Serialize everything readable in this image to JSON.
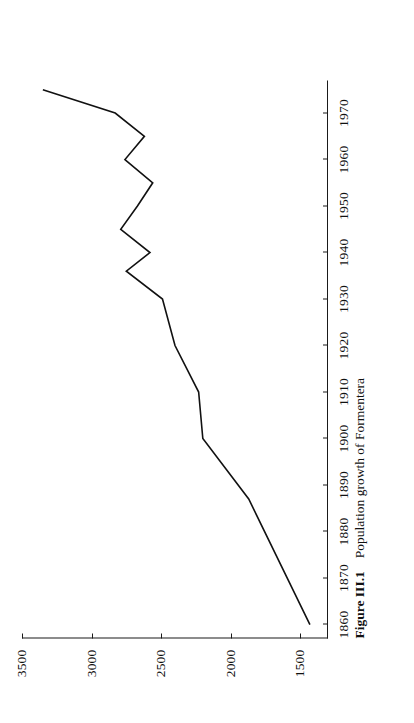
{
  "figure": {
    "caption_label": "Figure III.1",
    "caption_text": "Population growth of Formentera",
    "orientation": "rotated-90-ccw",
    "page_background": "#ffffff",
    "ink_color": "#111111"
  },
  "chart_data": {
    "type": "line",
    "title": "Population growth of Formentera",
    "xlabel": "",
    "ylabel": "",
    "xlim": [
      1857,
      1977
    ],
    "ylim": [
      1300,
      3500
    ],
    "grid": false,
    "legend": "none",
    "xticks": [
      1860,
      1870,
      1880,
      1890,
      1900,
      1910,
      1920,
      1930,
      1940,
      1950,
      1960,
      1970
    ],
    "yticks": [
      1500,
      2000,
      2500,
      3000,
      3500
    ],
    "x": [
      1860,
      1887,
      1900,
      1910,
      1920,
      1930,
      1936,
      1940,
      1945,
      1950,
      1955,
      1960,
      1965,
      1970,
      1975
    ],
    "values": [
      1430,
      1870,
      2200,
      2230,
      2400,
      2490,
      2750,
      2580,
      2790,
      2670,
      2560,
      2760,
      2620,
      2830,
      3350
    ],
    "series": [
      {
        "name": "Formentera population",
        "x": [
          1860,
          1887,
          1900,
          1910,
          1920,
          1930,
          1936,
          1940,
          1945,
          1950,
          1955,
          1960,
          1965,
          1970,
          1975
        ],
        "values": [
          1430,
          1870,
          2200,
          2230,
          2400,
          2490,
          2750,
          2580,
          2790,
          2670,
          2560,
          2760,
          2620,
          2830,
          3350
        ]
      }
    ]
  }
}
